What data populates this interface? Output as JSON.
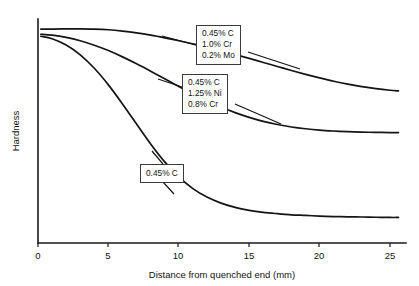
{
  "chart_data": {
    "type": "line",
    "title": "",
    "xlabel": "Distance from quenched end (mm)",
    "ylabel": "Hardness",
    "xlim": [
      0,
      26.5
    ],
    "ylim": [
      0,
      100
    ],
    "xticks": [
      0,
      5,
      10,
      15,
      20,
      25
    ],
    "xtick_labels": [
      "0",
      "5",
      "10",
      "15",
      "20",
      "25"
    ],
    "yticks": [],
    "ytick_labels": [],
    "grid": false,
    "legend": "none",
    "series": [
      {
        "name": "0.45% C, 1.0% Cr, 0.2% Mo",
        "x": [
          0.2,
          1,
          2,
          3,
          4,
          5,
          6,
          7,
          8,
          9,
          10,
          11,
          12,
          13,
          14,
          15,
          16,
          17,
          18,
          19,
          20,
          21,
          22,
          23,
          24,
          25,
          25.6
        ],
        "values": [
          95.5,
          95.5,
          95.6,
          95.6,
          95.5,
          95.2,
          94.6,
          93.8,
          92.8,
          91.6,
          90.3,
          88.9,
          87.4,
          85.8,
          84.1,
          82.4,
          80.6,
          78.8,
          77.0,
          75.3,
          73.7,
          72.2,
          70.9,
          69.8,
          68.9,
          68.2,
          67.9
        ]
      },
      {
        "name": "0.45% C, 1.25% Ni, 0.8% Cr",
        "x": [
          0.2,
          1,
          2,
          3,
          4,
          5,
          6,
          7,
          8,
          9,
          10,
          11,
          12,
          13,
          14,
          15,
          16,
          17,
          18,
          19,
          20,
          21,
          22,
          23,
          24,
          25,
          25.6
        ],
        "values": [
          93.2,
          92.8,
          91.8,
          90.3,
          88.3,
          85.9,
          83.1,
          80.0,
          76.7,
          73.3,
          69.9,
          66.6,
          63.5,
          60.7,
          58.2,
          56.1,
          54.3,
          52.9,
          51.8,
          51.0,
          50.4,
          50.0,
          49.7,
          49.5,
          49.4,
          49.3,
          49.3
        ]
      },
      {
        "name": "0.45% C",
        "x": [
          0.2,
          1,
          2,
          3,
          4,
          5,
          6,
          7,
          8,
          9,
          10,
          11,
          12,
          13,
          14,
          15,
          16,
          17,
          18,
          19,
          20,
          21,
          22,
          23,
          24,
          25,
          25.6
        ],
        "values": [
          92.3,
          91.2,
          88.4,
          84.0,
          78.0,
          70.6,
          62.1,
          53.1,
          44.2,
          36.2,
          29.5,
          24.3,
          20.5,
          17.8,
          15.9,
          14.6,
          13.7,
          13.1,
          12.6,
          12.3,
          12.0,
          11.8,
          11.7,
          11.6,
          11.5,
          11.4,
          11.4
        ]
      }
    ],
    "annotations": [
      {
        "id": "callout-0",
        "lines": [
          "0.45% C",
          "1.0% Cr",
          "0.2% Mo"
        ],
        "series_index": 0
      },
      {
        "id": "callout-1",
        "lines": [
          "0.45% C",
          "1.25% Ni",
          "0.8% Cr"
        ],
        "series_index": 1
      },
      {
        "id": "callout-2",
        "lines": [
          "0.45% C"
        ],
        "series_index": 2
      }
    ]
  }
}
